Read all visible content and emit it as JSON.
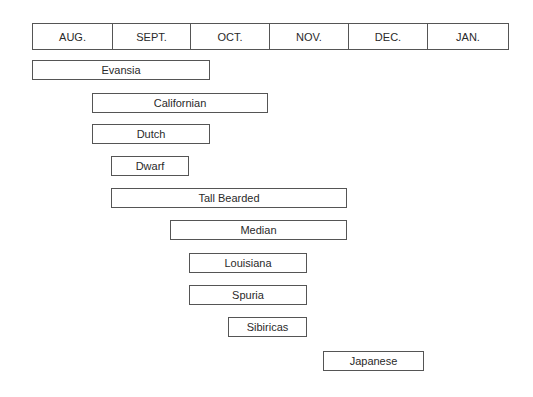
{
  "chart_data": {
    "type": "gantt",
    "title": "",
    "months": [
      "AUG.",
      "SEPT.",
      "OCT.",
      "NOV.",
      "DEC.",
      "JAN."
    ],
    "month_edges_px": [
      32,
      112,
      190,
      269,
      348,
      427,
      509
    ],
    "series": [
      {
        "name": "Evansia",
        "start": 0.0,
        "end": 2.25,
        "x": 32,
        "w": 178,
        "y": 60
      },
      {
        "name": "Californian",
        "start": 0.75,
        "end": 3.0,
        "x": 92,
        "w": 176,
        "y": 93
      },
      {
        "name": "Dutch",
        "start": 0.75,
        "end": 2.25,
        "x": 92,
        "w": 118,
        "y": 124
      },
      {
        "name": "Dwarf",
        "start": 1.0,
        "end": 2.0,
        "x": 111,
        "w": 78,
        "y": 156
      },
      {
        "name": "Tall Bearded",
        "start": 1.0,
        "end": 4.0,
        "x": 111,
        "w": 236,
        "y": 188
      },
      {
        "name": "Median",
        "start": 1.75,
        "end": 4.0,
        "x": 170,
        "w": 177,
        "y": 220
      },
      {
        "name": "Louisiana",
        "start": 2.0,
        "end": 3.5,
        "x": 189,
        "w": 118,
        "y": 253
      },
      {
        "name": "Spuria",
        "start": 2.0,
        "end": 3.5,
        "x": 189,
        "w": 118,
        "y": 285
      },
      {
        "name": "Sibiricas",
        "start": 2.5,
        "end": 3.5,
        "x": 228,
        "w": 79,
        "y": 317
      },
      {
        "name": "Japanese",
        "start": 3.7,
        "end": 5.0,
        "x": 323,
        "w": 101,
        "y": 351
      }
    ],
    "xlabel": "",
    "ylabel": ""
  }
}
